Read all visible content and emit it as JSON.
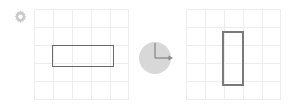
{
  "diagram": {
    "background_color": "#ffffff",
    "gear_icon": {
      "name": "gear-icon",
      "color": "#c9c9c9",
      "size_px": 13
    },
    "panels": [
      {
        "id": "before",
        "label": "Before rotation",
        "grid": {
          "columns": 5,
          "rows": 5,
          "cell_width_px": 19,
          "cell_height_px": 18,
          "line_color": "#ededf0",
          "x_px": 34,
          "y_px": 9,
          "width_px": 95,
          "height_px": 91
        },
        "shape": {
          "type": "rectangle",
          "orientation": "horizontal",
          "x_px": 18,
          "y_px": 36,
          "width_px": 62,
          "height_px": 22,
          "stroke_color": "#6b6b6b",
          "stroke_width_px": 1,
          "fill": "none",
          "grid_units_wide": 3,
          "grid_units_tall": 1
        }
      },
      {
        "id": "after",
        "label": "After rotation",
        "grid": {
          "columns": 5,
          "rows": 5,
          "cell_width_px": 19,
          "cell_height_px": 18,
          "line_color": "#ededf0",
          "x_px": 186,
          "y_px": 9,
          "width_px": 95,
          "height_px": 91
        },
        "shape": {
          "type": "rectangle",
          "orientation": "vertical",
          "x_px": 36,
          "y_px": 22,
          "width_px": 22,
          "height_px": 55,
          "stroke_color": "#7a7a7a",
          "stroke_width_px": 2,
          "fill": "none",
          "grid_units_wide": 1,
          "grid_units_tall": 3
        }
      }
    ],
    "rotation_indicator": {
      "name": "rotation-angle-dial",
      "angle_degrees": 90,
      "direction": "clockwise",
      "disc_fill": "#d8d8d8",
      "arm_color": "#8a8a8a",
      "x_px": 138,
      "y_px": 40,
      "diameter_px": 36,
      "arms": [
        {
          "name": "vertical-arm",
          "from": "center",
          "to": "top"
        },
        {
          "name": "horizontal-arm",
          "from": "center",
          "to": "right",
          "arrowhead": true
        }
      ]
    }
  }
}
